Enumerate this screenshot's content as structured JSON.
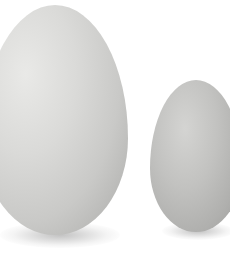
{
  "image": {
    "description": "Two white eggs side by side on a white background: a large egg on the left and a smaller egg on the right, with soft shadows beneath",
    "subjects": [
      {
        "name": "large-egg",
        "position": "left",
        "color": "#d6d6d4"
      },
      {
        "name": "small-egg",
        "position": "right",
        "color": "#bdbdbb"
      }
    ],
    "background_color": "#ffffff"
  }
}
